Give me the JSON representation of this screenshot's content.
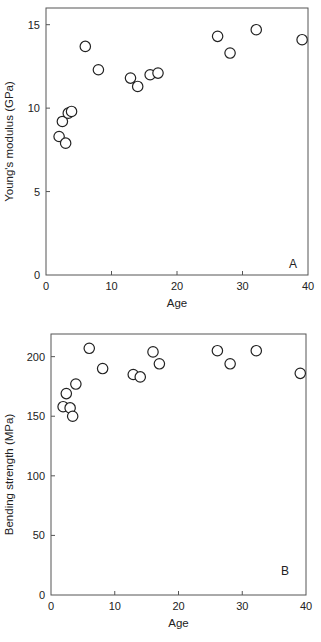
{
  "chart_data": [
    {
      "type": "scatter",
      "panel_label": "A",
      "title": "",
      "xlabel": "Age",
      "ylabel": "Young's modulus (GPa)",
      "xlim": [
        0,
        40
      ],
      "ylim": [
        0,
        16
      ],
      "xticks": [
        0,
        10,
        20,
        30,
        40
      ],
      "yticks": [
        0,
        5,
        10,
        15
      ],
      "grid": false,
      "legend": null,
      "marker": "open-circle",
      "points": [
        {
          "x": 2.0,
          "y": 8.3
        },
        {
          "x": 2.5,
          "y": 9.2
        },
        {
          "x": 3.0,
          "y": 7.9
        },
        {
          "x": 3.4,
          "y": 9.7
        },
        {
          "x": 3.9,
          "y": 9.8
        },
        {
          "x": 6.0,
          "y": 13.7
        },
        {
          "x": 8.0,
          "y": 12.3
        },
        {
          "x": 12.9,
          "y": 11.8
        },
        {
          "x": 14.0,
          "y": 11.3
        },
        {
          "x": 15.9,
          "y": 12.0
        },
        {
          "x": 17.1,
          "y": 12.1
        },
        {
          "x": 26.2,
          "y": 14.3
        },
        {
          "x": 28.1,
          "y": 13.3
        },
        {
          "x": 32.1,
          "y": 14.7
        },
        {
          "x": 39.1,
          "y": 14.1
        }
      ]
    },
    {
      "type": "scatter",
      "panel_label": "B",
      "title": "",
      "xlabel": "Age",
      "ylabel": "Bending strength (MPa)",
      "xlim": [
        0,
        40
      ],
      "ylim": [
        0,
        219
      ],
      "xticks": [
        0,
        10,
        20,
        30,
        40
      ],
      "yticks": [
        0,
        50,
        100,
        150,
        200
      ],
      "grid": false,
      "legend": null,
      "marker": "open-circle",
      "points": [
        {
          "x": 1.9,
          "y": 158
        },
        {
          "x": 2.4,
          "y": 169
        },
        {
          "x": 3.0,
          "y": 157
        },
        {
          "x": 3.4,
          "y": 150
        },
        {
          "x": 3.9,
          "y": 177
        },
        {
          "x": 6.0,
          "y": 207
        },
        {
          "x": 8.1,
          "y": 190
        },
        {
          "x": 12.9,
          "y": 185
        },
        {
          "x": 14.0,
          "y": 183
        },
        {
          "x": 16.0,
          "y": 204
        },
        {
          "x": 17.0,
          "y": 194
        },
        {
          "x": 26.1,
          "y": 205
        },
        {
          "x": 28.1,
          "y": 194
        },
        {
          "x": 32.2,
          "y": 205
        },
        {
          "x": 39.1,
          "y": 186
        }
      ]
    }
  ]
}
